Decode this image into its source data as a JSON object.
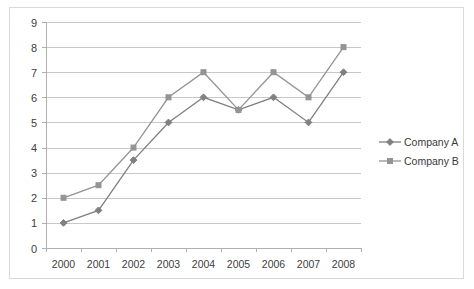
{
  "chart_data": {
    "type": "line",
    "title": "",
    "subtitle": "",
    "xlabel": "",
    "ylabel": "",
    "categories": [
      "2000",
      "2001",
      "2002",
      "2003",
      "2004",
      "2005",
      "2006",
      "2007",
      "2008"
    ],
    "series": [
      {
        "name": "Company A",
        "marker": "diamond",
        "color": "#808080",
        "values": [
          1,
          1.5,
          3.5,
          5,
          6,
          5.5,
          6,
          5,
          7
        ]
      },
      {
        "name": "Company B",
        "marker": "square",
        "color": "#949494",
        "values": [
          2,
          2.5,
          4,
          6,
          7,
          5.5,
          7,
          6,
          8
        ]
      }
    ],
    "ylim": [
      0,
      9
    ],
    "yticks": [
      0,
      1,
      2,
      3,
      4,
      5,
      6,
      7,
      8,
      9
    ],
    "ytick_labels": [
      "0",
      "1",
      "2",
      "3",
      "4",
      "5",
      "6",
      "7",
      "8",
      "9"
    ],
    "grid": true,
    "grid_axis": "y",
    "legend_position": "right",
    "legend_entries": [
      "Company A",
      "Company B"
    ],
    "colors": {
      "grid": "#c8c8c8",
      "axis": "#b0b0b0",
      "text": "#404040",
      "frame_border": "#d9d9d9",
      "series_a": "#808080",
      "series_b": "#949494",
      "background": "#ffffff"
    }
  }
}
